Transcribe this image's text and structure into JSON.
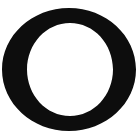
{
  "image": {
    "kind": "glyph-specimen",
    "description": "Single large black serif capital letter O on a plain white background",
    "width_px": 140,
    "height_px": 138
  },
  "glyph": {
    "character": "O",
    "name": "latin-capital-letter-o",
    "style": "serif",
    "stroke_color": "#0d0d0d",
    "background_color": "#ffffff",
    "outer": {
      "left_px": 2,
      "right_px": 136,
      "top_px": 8,
      "bottom_px": 131,
      "center_x_px": 69,
      "center_y_px": 69.5,
      "radius_x_px": 67,
      "radius_y_px": 61.5
    },
    "counter": {
      "left_px": 27,
      "right_px": 113,
      "top_px": 23,
      "bottom_px": 116,
      "center_x_px": 70,
      "center_y_px": 69.5,
      "radius_x_px": 43,
      "radius_y_px": 46.5
    },
    "stroke_weight": {
      "side_px": 25,
      "top_bottom_px": 14,
      "stress": "vertical"
    }
  }
}
